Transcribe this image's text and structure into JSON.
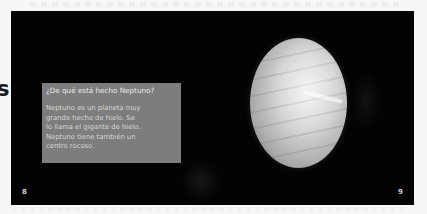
{
  "spread": {
    "background_color": "#030303",
    "margin_bleed_letter": "s"
  },
  "info_box": {
    "title": "¿De qué está hecho Neptuno?",
    "body_lines": [
      "Neptuno es un planeta muy",
      "grande hecho de hielo. Se",
      "lo llama el gigante de hielo.",
      "Neptuno tiene también un",
      "centro rocoso."
    ],
    "fill_color": "#7d7d7d"
  },
  "image": {
    "subject": "planet-neptune"
  },
  "pages": {
    "left_number": "8",
    "right_number": "9"
  }
}
